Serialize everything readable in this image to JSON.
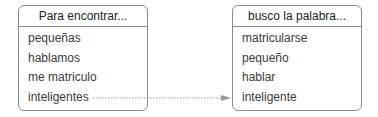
{
  "left_box": {
    "header": "Para encontrar...",
    "items": [
      "pequeñas",
      "hablamos",
      "me matriculo",
      "inteligentes"
    ]
  },
  "right_box": {
    "header": "busco la palabra...",
    "items": [
      "matricularse",
      "pequeño",
      "hablar",
      "inteligente"
    ]
  },
  "arrow": {
    "from": "inteligentes",
    "to": "inteligente",
    "style": "dotted",
    "color": "#999999"
  }
}
